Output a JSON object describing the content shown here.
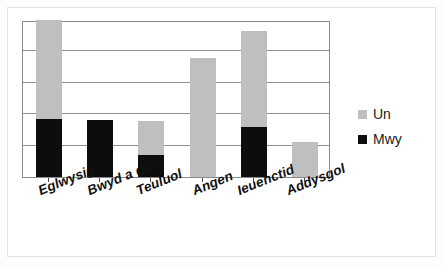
{
  "chart_data": {
    "type": "bar",
    "subtype": "stacked-vertical",
    "title": "",
    "subtitle": "",
    "xlabel": "",
    "ylabel": "",
    "categories": [
      "Eglwysig",
      "Bwyd a diod",
      "Teuluol",
      "Angen",
      "Ieuenctid",
      "Addysgol"
    ],
    "series": [
      {
        "name": "Un",
        "color": "#bfbfbf",
        "values": [
          3.15,
          0,
          1.1,
          3.8,
          3.07,
          1.13
        ]
      },
      {
        "name": "Mwy",
        "color": "#0d0d0d",
        "values": [
          1.85,
          1.8,
          0.7,
          0,
          1.58,
          0
        ]
      }
    ],
    "stack_totals": [
      5.0,
      1.8,
      1.8,
      3.8,
      4.65,
      1.13
    ],
    "ylim": [
      0,
      5
    ],
    "yticks": [
      0,
      1,
      2,
      3,
      4,
      5
    ],
    "ytick_labels": [
      "",
      "",
      "",
      "",
      "",
      ""
    ],
    "grid": true,
    "grid_axis": "y",
    "legend": {
      "position": "right",
      "entries": [
        {
          "label": "Un",
          "color": "#bfbfbf"
        },
        {
          "label": "Mwy",
          "color": "#0d0d0d"
        }
      ]
    },
    "axis_colors": {
      "plot_border": "#8a8a8a",
      "gridline": "#8f8f8f",
      "background": "#ffffff"
    }
  },
  "legend": {
    "un_label": "Un",
    "mwy_label": "Mwy"
  },
  "xaxis": {
    "labels": [
      "Eglwysig",
      "Bwyd a diod",
      "Teuluol",
      "Angen",
      "Ieuenctid",
      "Addysgol"
    ]
  }
}
